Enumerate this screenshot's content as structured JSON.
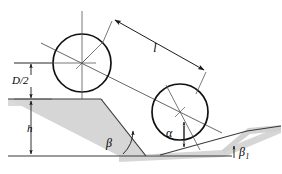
{
  "figure": {
    "type": "engineering-diagram",
    "background_color": "#ffffff",
    "line_color": "#1a1a1a",
    "thin_line_color": "#555555",
    "terrain_fill_color": "#d6d6d6",
    "terrain_band_color": "#cfcfcf"
  },
  "labels": {
    "length": "l",
    "diameter_half": "D/2",
    "height": "h",
    "alpha": "α",
    "beta": "β",
    "beta_one": "β",
    "beta_one_subscript": "1"
  },
  "geometry": {
    "upper_circle": {
      "cx": 82,
      "cy": 63,
      "r": 29
    },
    "lower_circle": {
      "cx": 180,
      "cy": 112,
      "r": 28
    },
    "ground_top_y": 99,
    "ground_bottom_y": 156,
    "terrain_band_thickness": 7
  },
  "label_positions": {
    "length": {
      "x": 155,
      "y": 52
    },
    "diameter_half": {
      "x": 12,
      "y": 82
    },
    "height": {
      "x": 29,
      "y": 131
    },
    "alpha": {
      "x": 166,
      "y": 136
    },
    "beta": {
      "x": 110,
      "y": 145
    },
    "beta_one": {
      "x": 242,
      "y": 160
    }
  },
  "icons": {
    "arrowhead": "arrowhead-icon",
    "dimension_line": "dimension-line-icon",
    "angle_arc": "angle-arc-icon",
    "centerline": "centerline-icon"
  }
}
